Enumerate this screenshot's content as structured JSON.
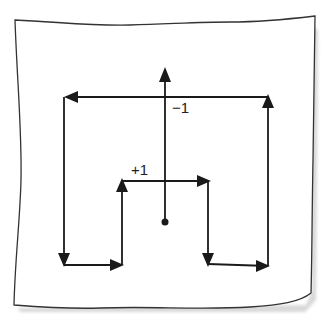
{
  "diagram": {
    "colors": {
      "ink": "#1a1a1a",
      "paper": "#ffffff",
      "shadow": "#c8c8c8"
    },
    "labels": {
      "minus_one": "−1",
      "plus_one": "+1"
    },
    "central_arrow": {
      "from": [
        165,
        222
      ],
      "to": [
        165,
        70
      ],
      "direction": "up",
      "start_marker": "dot"
    },
    "loop_path": [
      {
        "from": [
          268,
          97
        ],
        "to": [
          66,
          97
        ],
        "direction": "left"
      },
      {
        "from": [
          64,
          97
        ],
        "to": [
          64,
          262
        ],
        "direction": "down"
      },
      {
        "from": [
          64,
          265
        ],
        "to": [
          122,
          265
        ],
        "direction": "right"
      },
      {
        "from": [
          122,
          265
        ],
        "to": [
          122,
          182
        ],
        "direction": "up"
      },
      {
        "from": [
          122,
          181
        ],
        "to": [
          208,
          181
        ],
        "direction": "right"
      },
      {
        "from": [
          208,
          181
        ],
        "to": [
          208,
          262
        ],
        "direction": "down"
      },
      {
        "from": [
          208,
          264
        ],
        "to": [
          268,
          266
        ],
        "direction": "right"
      },
      {
        "from": [
          268,
          266
        ],
        "to": [
          268,
          99
        ],
        "direction": "up"
      }
    ]
  }
}
